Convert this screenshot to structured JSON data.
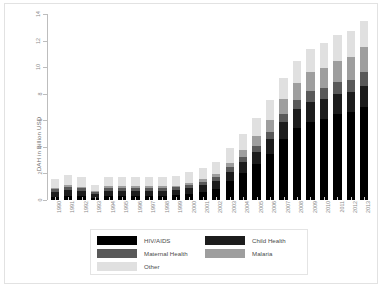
{
  "chart_data": {
    "type": "bar",
    "subtype": "stacked-bar",
    "title": "",
    "xlabel": "",
    "ylabel": "DAH in Billion USD",
    "ylim": [
      0,
      14
    ],
    "yticks": [
      0,
      2,
      4,
      6,
      8,
      10,
      12,
      14
    ],
    "ytick_labels": [
      "0",
      "2",
      "4",
      "6",
      "8",
      "10",
      "12",
      "14"
    ],
    "grid": false,
    "legend_position": "bottom",
    "legend_columns": 2,
    "categories": [
      "1990",
      "1991",
      "1992",
      "1993",
      "1994",
      "1995",
      "1996",
      "1997",
      "1998",
      "1999",
      "2000",
      "2001",
      "2002",
      "2003",
      "2004",
      "2005",
      "2006",
      "2007",
      "2008",
      "2009",
      "2010",
      "2011",
      "2012",
      "2013"
    ],
    "series": [
      {
        "name": "HIV/AIDS",
        "color": "#000000",
        "values": [
          0.25,
          0.3,
          0.28,
          0.18,
          0.3,
          0.3,
          0.3,
          0.3,
          0.3,
          0.35,
          0.45,
          0.6,
          0.85,
          1.4,
          2.0,
          2.7,
          3.5,
          4.6,
          5.4,
          5.9,
          6.1,
          6.5,
          6.6,
          7.0
        ]
      },
      {
        "name": "Child Health",
        "color": "#1c1c1c",
        "values": [
          0.35,
          0.45,
          0.4,
          0.25,
          0.4,
          0.4,
          0.4,
          0.4,
          0.4,
          0.4,
          0.45,
          0.5,
          0.55,
          0.7,
          0.85,
          0.95,
          1.1,
          1.3,
          1.45,
          1.5,
          1.5,
          1.5,
          1.5,
          1.6
        ]
      },
      {
        "name": "Maternal Health",
        "color": "#595959",
        "values": [
          0.2,
          0.25,
          0.22,
          0.15,
          0.22,
          0.22,
          0.22,
          0.22,
          0.22,
          0.22,
          0.25,
          0.28,
          0.3,
          0.35,
          0.4,
          0.45,
          0.5,
          0.6,
          0.7,
          0.8,
          0.85,
          0.9,
          0.95,
          1.0
        ]
      },
      {
        "name": "Malaria",
        "color": "#9e9e9e",
        "values": [
          0.1,
          0.12,
          0.1,
          0.07,
          0.1,
          0.1,
          0.1,
          0.1,
          0.1,
          0.12,
          0.15,
          0.18,
          0.25,
          0.35,
          0.5,
          0.7,
          0.9,
          1.1,
          1.25,
          1.4,
          1.5,
          1.6,
          1.7,
          1.9
        ]
      },
      {
        "name": "Other",
        "color": "#e0e0e0",
        "values": [
          0.65,
          0.78,
          0.7,
          0.45,
          0.68,
          0.68,
          0.68,
          0.68,
          0.68,
          0.71,
          0.8,
          0.84,
          0.95,
          1.1,
          1.25,
          1.4,
          1.5,
          1.6,
          1.7,
          1.8,
          1.85,
          1.9,
          1.95,
          2.0
        ]
      }
    ],
    "totals": [
      1.55,
      1.9,
      1.7,
      1.1,
      1.7,
      1.7,
      1.7,
      1.7,
      1.7,
      1.8,
      2.1,
      2.4,
      2.9,
      3.9,
      5.0,
      6.2,
      7.5,
      9.2,
      10.5,
      11.4,
      11.8,
      12.4,
      12.7,
      13.5
    ]
  },
  "legend": {
    "items": [
      {
        "label": "HIV/AIDS",
        "color": "#000000",
        "swatch_name": "legend-swatch-hiv-aids"
      },
      {
        "label": "Child Health",
        "color": "#1c1c1c",
        "swatch_name": "legend-swatch-child-health"
      },
      {
        "label": "Maternal Health",
        "color": "#595959",
        "swatch_name": "legend-swatch-maternal-health"
      },
      {
        "label": "Malaria",
        "color": "#9e9e9e",
        "swatch_name": "legend-swatch-malaria"
      },
      {
        "label": "Other",
        "color": "#e0e0e0",
        "swatch_name": "legend-swatch-other"
      }
    ],
    "order": [
      "HIV/AIDS",
      "Child Health",
      "Maternal Health",
      "Malaria",
      "Other"
    ]
  },
  "colors": {
    "background": "#ffffff",
    "frame": "#e2e2e2",
    "axis": "#bdbdbd",
    "tick_text": "#8a8a8a",
    "axis_title": "#6e6e6e",
    "legend_text": "#4a4a4a",
    "legend_border": "#e4e4e4"
  }
}
